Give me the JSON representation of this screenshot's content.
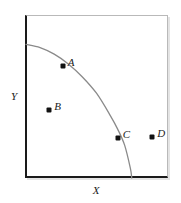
{
  "figure": {
    "title": "",
    "background_color": "#ffffff",
    "axis_color": "#1a1a1a",
    "frame_light_color": "#b9b9b9",
    "curve_color": "#8a8a8a",
    "point_color": "#121212"
  },
  "axes": {
    "x_label": "X",
    "y_label": "Y"
  },
  "chart_data": {
    "type": "line",
    "title": "",
    "xlabel": "X",
    "ylabel": "Y",
    "grid": false,
    "legend": null,
    "xlim": [
      0,
      1
    ],
    "ylim": [
      0,
      1
    ],
    "series": [
      {
        "name": "curve",
        "style": "concave-decreasing",
        "x": [
          0.0,
          0.1,
          0.2,
          0.3,
          0.4,
          0.5,
          0.6,
          0.65,
          0.7,
          0.74,
          0.75
        ],
        "y": [
          0.82,
          0.8,
          0.76,
          0.7,
          0.62,
          0.52,
          0.38,
          0.3,
          0.2,
          0.06,
          0.0
        ]
      }
    ],
    "points": [
      {
        "label": "A",
        "x": 0.26,
        "y": 0.685,
        "on_curve": true,
        "label_side": "right"
      },
      {
        "label": "B",
        "x": 0.165,
        "y": 0.42,
        "on_curve": false,
        "label_side": "right"
      },
      {
        "label": "C",
        "x": 0.65,
        "y": 0.245,
        "on_curve": true,
        "label_side": "right"
      },
      {
        "label": "D",
        "x": 0.895,
        "y": 0.25,
        "on_curve": false,
        "label_side": "right"
      }
    ]
  }
}
